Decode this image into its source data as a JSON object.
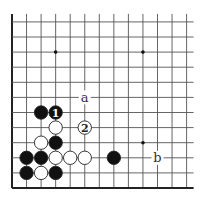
{
  "diagram": {
    "type": "go-board-corner",
    "grid": {
      "origin_x": 12,
      "origin_y": 188,
      "spacing_x": 14.55,
      "spacing_y": 15.1,
      "cols": 13,
      "rows": 12,
      "line_color": "#555555",
      "edge_color": "#222222"
    },
    "star_points": [
      {
        "col": 3,
        "row": 9
      },
      {
        "col": 9,
        "row": 9
      },
      {
        "col": 9,
        "row": 3
      }
    ],
    "stones": [
      {
        "color": "black",
        "col": 2,
        "row": 5,
        "label": ""
      },
      {
        "color": "black",
        "col": 3,
        "row": 5,
        "label": "1"
      },
      {
        "color": "white",
        "col": 3,
        "row": 4,
        "label": ""
      },
      {
        "color": "white",
        "col": 5,
        "row": 4,
        "label": "2"
      },
      {
        "color": "white",
        "col": 2,
        "row": 3,
        "label": ""
      },
      {
        "color": "black",
        "col": 3,
        "row": 3,
        "label": ""
      },
      {
        "color": "black",
        "col": 1,
        "row": 2,
        "label": ""
      },
      {
        "color": "black",
        "col": 2,
        "row": 2,
        "label": ""
      },
      {
        "color": "white",
        "col": 3,
        "row": 2,
        "label": ""
      },
      {
        "color": "white",
        "col": 4,
        "row": 2,
        "label": ""
      },
      {
        "color": "white",
        "col": 5,
        "row": 2,
        "label": ""
      },
      {
        "color": "black",
        "col": 7,
        "row": 2,
        "label": ""
      },
      {
        "color": "black",
        "col": 1,
        "row": 1,
        "label": ""
      },
      {
        "color": "white",
        "col": 2,
        "row": 1,
        "label": ""
      },
      {
        "color": "black",
        "col": 3,
        "row": 1,
        "label": ""
      }
    ],
    "markers": [
      {
        "text": "a",
        "col": 5,
        "row": 6
      },
      {
        "text": "b",
        "col": 10,
        "row": 2
      }
    ]
  }
}
